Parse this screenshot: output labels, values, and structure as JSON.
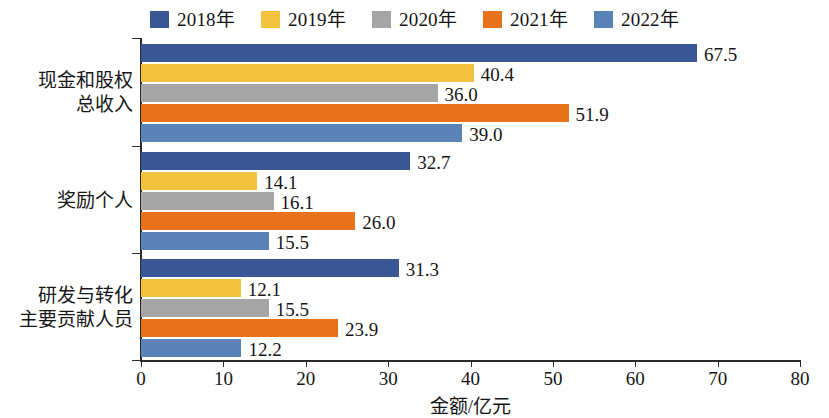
{
  "legend": {
    "items": [
      {
        "label": "2018年",
        "color": "#3a5795"
      },
      {
        "label": "2019年",
        "color": "#f3c33f"
      },
      {
        "label": "2020年",
        "color": "#a5a5a5"
      },
      {
        "label": "2021年",
        "color": "#e8711c"
      },
      {
        "label": "2022年",
        "color": "#5b83b8"
      }
    ]
  },
  "axis": {
    "x_title": "金额/亿元",
    "ticks": [
      "0",
      "10",
      "20",
      "30",
      "40",
      "50",
      "60",
      "70",
      "80"
    ]
  },
  "categories": [
    {
      "line1": "现金和股权",
      "line2": "总收入"
    },
    {
      "line1": "奖励个人",
      "line2": ""
    },
    {
      "line1": "研发与转化",
      "line2": "主要贡献人员"
    }
  ],
  "chart_data": {
    "type": "bar",
    "orientation": "horizontal",
    "title": "",
    "xlabel": "金额/亿元",
    "ylabel": "",
    "xlim": [
      0,
      80
    ],
    "xticks": [
      0,
      10,
      20,
      30,
      40,
      50,
      60,
      70,
      80
    ],
    "grid": false,
    "legend_position": "top-center",
    "categories": [
      "现金和股权总收入",
      "奖励个人",
      "研发与转化主要贡献人员"
    ],
    "series": [
      {
        "name": "2018年",
        "color": "#3a5795",
        "values": [
          67.5,
          32.7,
          31.3
        ]
      },
      {
        "name": "2019年",
        "color": "#f3c33f",
        "values": [
          40.4,
          14.1,
          12.1
        ]
      },
      {
        "name": "2020年",
        "color": "#a5a5a5",
        "values": [
          36.0,
          16.1,
          15.5
        ]
      },
      {
        "name": "2021年",
        "color": "#e8711c",
        "values": [
          51.9,
          26.0,
          23.9
        ]
      },
      {
        "name": "2022年",
        "color": "#5b83b8",
        "values": [
          39.0,
          15.5,
          12.2
        ]
      }
    ],
    "data_labels": [
      [
        "67.5",
        "40.4",
        "36.0",
        "51.9",
        "39.0"
      ],
      [
        "32.7",
        "14.1",
        "16.1",
        "26.0",
        "15.5"
      ],
      [
        "31.3",
        "12.1",
        "15.5",
        "23.9",
        "12.2"
      ]
    ]
  }
}
